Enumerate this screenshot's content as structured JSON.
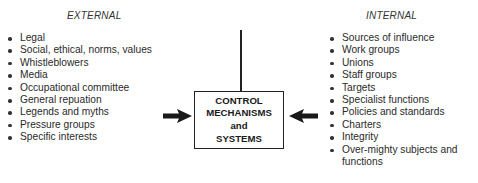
{
  "external": {
    "heading": "EXTERNAL",
    "items": [
      "Legal",
      "Social, ethical, norms, values",
      "Whistleblowers",
      "Media",
      "Occupational committee",
      "General repuation",
      "Legends and myths",
      "Pressure groups",
      "Specific interests"
    ]
  },
  "internal": {
    "heading": "INTERNAL",
    "items": [
      "Sources of influence",
      "Work groups",
      "Unions",
      "Staff groups",
      "Targets",
      "Specialist functions",
      "Policies and standards",
      "Charters",
      "Integrity",
      "Over-mighty subjects and functions"
    ]
  },
  "center": {
    "lines": [
      "CONTROL",
      "MECHANISMS",
      "and",
      "SYSTEMS"
    ]
  },
  "colors": {
    "stroke": "#222222",
    "text": "#2a2a2a",
    "background": "#ffffff"
  }
}
